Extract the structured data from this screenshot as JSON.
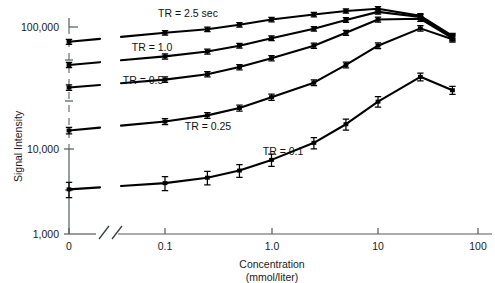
{
  "chart_data": {
    "type": "line",
    "title": "",
    "xlabel": "Concentration",
    "xlabel_units": "(mmol/liter)",
    "ylabel": "Signal Intensity",
    "xscale": "log",
    "yscale": "log",
    "xlim": [
      0.03,
      150
    ],
    "ylim": [
      1000,
      200000
    ],
    "x_tick_labels": [
      "0",
      "0.1",
      "1.0",
      "10",
      "100"
    ],
    "y_tick_labels": [
      "1,000",
      "10,000",
      "100,000"
    ],
    "grid": false,
    "legend_position": "inline-annotations",
    "axis_breaks": {
      "x": "double-slash break between 0 and the logarithmic decade region",
      "y": "dashed segment on vertical axis below 100,000"
    },
    "series": [
      {
        "name": "TR = 2.5 sec",
        "label": "TR = 2.5 sec",
        "x": [
          0,
          0.1,
          0.25,
          0.5,
          1.0,
          2.5,
          5.0,
          10,
          25,
          50
        ],
        "values": [
          72000,
          88000,
          95000,
          105000,
          118000,
          132000,
          143000,
          150000,
          128000,
          82000
        ],
        "errors": [
          4000,
          4500,
          5000,
          5500,
          6000,
          6500,
          7000,
          7500,
          7000,
          5000
        ]
      },
      {
        "name": "TR = 1.0",
        "label": "TR = 1.0",
        "x": [
          0,
          0.1,
          0.25,
          0.5,
          1.0,
          2.5,
          5.0,
          10,
          25,
          50
        ],
        "values": [
          43000,
          52000,
          58000,
          66000,
          78000,
          96000,
          117000,
          140000,
          125000,
          80000
        ],
        "errors": [
          2500,
          3000,
          3200,
          3600,
          4000,
          5000,
          6000,
          7000,
          6500,
          4800
        ]
      },
      {
        "name": "TR = 0.5",
        "label": "TR = 0.5",
        "x": [
          0,
          0.1,
          0.25,
          0.5,
          1.0,
          2.5,
          5.0,
          10,
          25,
          50
        ],
        "values": [
          26000,
          31000,
          35000,
          41000,
          50000,
          66000,
          88000,
          118000,
          120000,
          78000
        ],
        "errors": [
          1600,
          1900,
          2100,
          2400,
          2900,
          3800,
          5000,
          6500,
          6500,
          4600
        ]
      },
      {
        "name": "TR = 0.25",
        "label": "TR = 0.25",
        "x": [
          0,
          0.1,
          0.25,
          0.5,
          1.0,
          2.5,
          5.0,
          10,
          25,
          50
        ],
        "values": [
          10000,
          12200,
          14000,
          16500,
          21000,
          29000,
          43000,
          66000,
          97000,
          76000
        ],
        "errors": [
          700,
          800,
          900,
          1100,
          1400,
          1900,
          2800,
          4200,
          6000,
          4500
        ]
      },
      {
        "name": "TR = 0.1",
        "label": "TR = 0.1",
        "x": [
          0,
          0.1,
          0.25,
          0.5,
          1.0,
          2.5,
          5.0,
          10,
          25,
          50
        ],
        "values": [
          2700,
          3100,
          3500,
          4100,
          5200,
          7600,
          11500,
          19000,
          33000,
          24500
        ],
        "errors": [
          450,
          480,
          520,
          580,
          700,
          950,
          1400,
          2200,
          2800,
          2200
        ]
      }
    ],
    "annotations": [
      {
        "text": "TR = 2.5 sec",
        "x_px": 188,
        "y_px": 17
      },
      {
        "text": "TR = 1.0",
        "x_px": 152,
        "y_px": 51
      },
      {
        "text": "TR = 0.5",
        "x_px": 143,
        "y_px": 84
      },
      {
        "text": "TR = 0.25",
        "x_px": 208,
        "y_px": 130
      },
      {
        "text": "TR = 0.1",
        "x_px": 283,
        "y_px": 155
      }
    ]
  }
}
